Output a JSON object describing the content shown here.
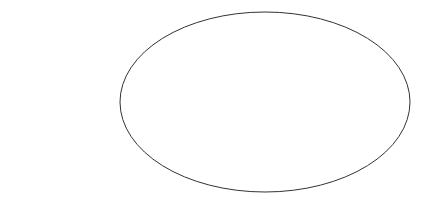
{
  "diagram": {
    "body_label": "SUN",
    "direction_label_line1": "To",
    "direction_label_line2": "Earth",
    "annotation_line1": "Depth from which",
    "annotation_line2": "observed radiation",
    "annotation_line3": "originates",
    "figure_label": "Fig. 74",
    "arrow_count": 11,
    "arrow_y": [
      15,
      29,
      44,
      62,
      80,
      99,
      120,
      141,
      161,
      175,
      185
    ],
    "line_color": "#333333"
  }
}
